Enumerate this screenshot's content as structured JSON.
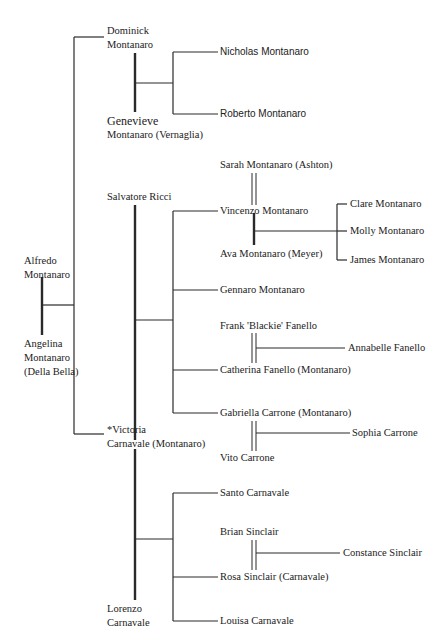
{
  "diagram": {
    "type": "family-tree",
    "people": {
      "dominick": "Dominick",
      "dominick_surname": "Montanaro",
      "genevieve": "Genevieve",
      "genevieve_surname": "Montanaro (Vernaglia)",
      "nicholas": "Nicholas Montanaro",
      "roberto": "Roberto Montanaro",
      "sarah": "Sarah Montanaro (Ashton)",
      "salvatore": "Salvatore Ricci",
      "vincenzo": "Vincenzo Montanaro",
      "ava": "Ava Montanaro (Meyer)",
      "clare": "Clare Montanaro",
      "molly": "Molly Montanaro",
      "james": "James Montanaro",
      "alfredo": "Alfredo",
      "alfredo_surname": "Montanaro",
      "angelina": "Angelina",
      "angelina_surname": "Montanaro",
      "angelina_maiden": "(Della Bella)",
      "gennaro": "Gennaro Montanaro",
      "frank": "Frank 'Blackie' Fanello",
      "annabelle": "Annabelle Fanello",
      "catherina": "Catherina Fanello (Montanaro)",
      "gabriella": "Gabriella Carrone (Montanaro)",
      "sophia": "Sophia Carrone",
      "vito": "Vito  Carrone",
      "victoria": "*Victoria",
      "victoria_surname": "Carnavale (Montanaro)",
      "santo": "Santo Carnavale",
      "brian": "Brian Sinclair",
      "constance": "Constance Sinclair",
      "rosa": "Rosa  Sinclair (Carnavale)",
      "lorenzo": "Lorenzo",
      "lorenzo_surname": "Carnavale",
      "louisa": "Louisa Carnavale"
    },
    "couples": [
      {
        "partners": [
          "Alfredo Montanaro",
          "Angelina Montanaro (Della Bella)"
        ],
        "children": [
          "Dominick Montanaro",
          "Salvatore Ricci / Victoria Carnavale (Montanaro)"
        ]
      },
      {
        "partners": [
          "Dominick Montanaro",
          "Genevieve Montanaro (Vernaglia)"
        ],
        "children": [
          "Nicholas Montanaro",
          "Roberto Montanaro"
        ]
      },
      {
        "partners": [
          "Salvatore Ricci",
          "Victoria Carnavale (Montanaro)"
        ],
        "children": [
          "Vincenzo Montanaro",
          "Gennaro Montanaro",
          "Catherina Fanello (Montanaro)",
          "Gabriella Carrone (Montanaro)"
        ]
      },
      {
        "partners": [
          "Sarah Montanaro (Ashton)",
          "Vincenzo Montanaro"
        ],
        "children": []
      },
      {
        "partners": [
          "Vincenzo Montanaro",
          "Ava Montanaro (Meyer)"
        ],
        "children": [
          "Clare Montanaro",
          "Molly Montanaro",
          "James Montanaro"
        ]
      },
      {
        "partners": [
          "Frank 'Blackie' Fanello",
          "Catherina Fanello (Montanaro)"
        ],
        "children": [
          "Annabelle Fanello"
        ]
      },
      {
        "partners": [
          "Gabriella Carrone (Montanaro)",
          "Vito Carrone"
        ],
        "children": [
          "Sophia Carrone"
        ]
      },
      {
        "partners": [
          "Victoria Carnavale (Montanaro)",
          "Lorenzo Carnavale"
        ],
        "children": [
          "Santo Carnavale",
          "Rosa Sinclair (Carnavale)",
          "Louisa Carnavale"
        ]
      },
      {
        "partners": [
          "Brian Sinclair",
          "Rosa Sinclair (Carnavale)"
        ],
        "children": [
          "Constance Sinclair"
        ]
      }
    ]
  }
}
